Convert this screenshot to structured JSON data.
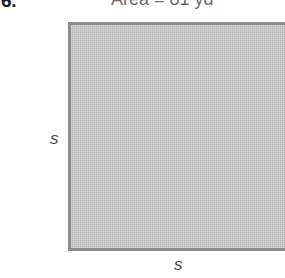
{
  "figure": {
    "problem_label": "6.",
    "area_caption": {
      "prefix": "Area = 81 yd",
      "exponent": "2",
      "full_text": "Area = 81 yd²",
      "quantity": 81,
      "unit": "yd²"
    },
    "shape": {
      "kind": "square",
      "fill_color": "#c2c2c2",
      "border_color": "#8c8c8c"
    },
    "labels": {
      "left_side": "s",
      "bottom_side": "s"
    }
  }
}
